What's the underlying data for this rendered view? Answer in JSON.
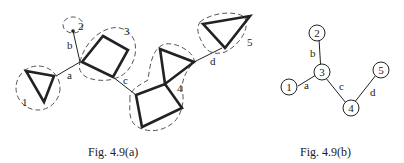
{
  "figure_a": {
    "caption": "Fig. 4.9(a)",
    "block_labels": [
      "1",
      "2",
      "3",
      "4",
      "5"
    ],
    "edge_labels": [
      "a",
      "b",
      "c",
      "d"
    ]
  },
  "figure_b": {
    "caption": "Fig. 4.9(b)",
    "nodes": [
      {
        "id": "1",
        "label": "1"
      },
      {
        "id": "2",
        "label": "2"
      },
      {
        "id": "3",
        "label": "3"
      },
      {
        "id": "4",
        "label": "4"
      },
      {
        "id": "5",
        "label": "5"
      }
    ],
    "edges": [
      {
        "label": "a",
        "from": "1",
        "to": "3"
      },
      {
        "label": "b",
        "from": "2",
        "to": "3"
      },
      {
        "label": "c",
        "from": "3",
        "to": "4"
      },
      {
        "label": "d",
        "from": "4",
        "to": "5"
      }
    ]
  }
}
